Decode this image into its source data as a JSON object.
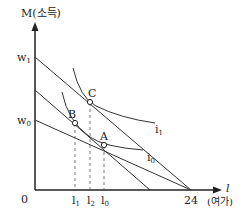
{
  "diagram": {
    "y_axis_label": "M(소득)",
    "x_axis_symbol": "l",
    "x_axis_label": "(여가)",
    "origin_label": "0",
    "x_max_label": "24",
    "y_ticks": {
      "w1": "w",
      "w1_sub": "1",
      "w0": "w",
      "w0_sub": "0"
    },
    "points": {
      "A": "A",
      "B": "B",
      "C": "C"
    },
    "curves": {
      "i1": "i",
      "i1_sub": "1",
      "i0": "i",
      "i0_sub": "0"
    },
    "x_ticks": [
      {
        "base": "l",
        "sub": "1"
      },
      {
        "base": "l",
        "sub": "2"
      },
      {
        "base": "l",
        "sub": "0"
      }
    ]
  }
}
